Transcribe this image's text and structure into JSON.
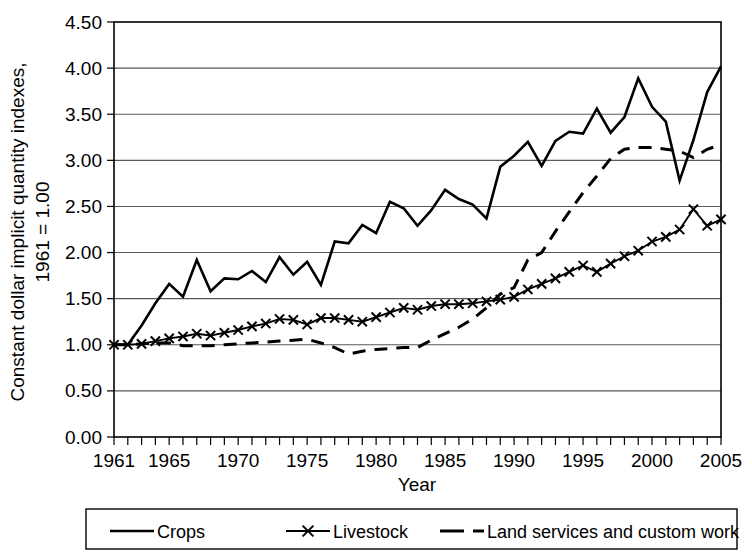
{
  "chart_data": {
    "type": "line",
    "title": "",
    "xlabel": "Year",
    "ylabel": "Constant dollar implicit quantity indexes, 1961 = 1.00",
    "ylabel_line1": "Constant dollar implicit quantity indexes,",
    "ylabel_line2": "1961 = 1.00",
    "xlim": [
      1961,
      2005
    ],
    "ylim": [
      0.0,
      4.5
    ],
    "ytick_labels": [
      "0.00",
      "0.50",
      "1.00",
      "1.50",
      "2.00",
      "2.50",
      "3.00",
      "3.50",
      "4.00",
      "4.50"
    ],
    "ytick_values": [
      0.0,
      0.5,
      1.0,
      1.5,
      2.0,
      2.5,
      3.0,
      3.5,
      4.0,
      4.5
    ],
    "xtick_labels": [
      "1961",
      "1965",
      "1970",
      "1975",
      "1980",
      "1985",
      "1990",
      "1995",
      "2000",
      "2005"
    ],
    "xtick_values": [
      1961,
      1965,
      1970,
      1975,
      1980,
      1985,
      1990,
      1995,
      2000,
      2005
    ],
    "grid": "horizontal",
    "legend_position": "bottom",
    "x": [
      1961,
      1962,
      1963,
      1964,
      1965,
      1966,
      1967,
      1968,
      1969,
      1970,
      1971,
      1972,
      1973,
      1974,
      1975,
      1976,
      1977,
      1978,
      1979,
      1980,
      1981,
      1982,
      1983,
      1984,
      1985,
      1986,
      1987,
      1988,
      1989,
      1990,
      1991,
      1992,
      1993,
      1994,
      1995,
      1996,
      1997,
      1998,
      1999,
      2000,
      2001,
      2002,
      2003,
      2004,
      2005
    ],
    "series": [
      {
        "name": "Crops",
        "style": "solid",
        "marker": "none",
        "color": "#000000",
        "values": [
          1.0,
          1.0,
          1.21,
          1.45,
          1.66,
          1.52,
          1.92,
          1.58,
          1.72,
          1.71,
          1.8,
          1.68,
          1.95,
          1.76,
          1.9,
          1.65,
          2.12,
          2.1,
          2.3,
          2.21,
          2.55,
          2.48,
          2.29,
          2.46,
          2.68,
          2.58,
          2.52,
          2.37,
          2.93,
          3.05,
          3.2,
          2.94,
          3.21,
          3.31,
          3.29,
          3.56,
          3.3,
          3.47,
          3.89,
          3.58,
          3.42,
          2.78,
          3.22,
          3.74,
          4.02
        ]
      },
      {
        "name": "Livestock",
        "style": "solid",
        "marker": "x",
        "color": "#000000",
        "values": [
          1.0,
          1.0,
          1.01,
          1.04,
          1.07,
          1.09,
          1.12,
          1.1,
          1.13,
          1.16,
          1.2,
          1.23,
          1.28,
          1.27,
          1.22,
          1.29,
          1.29,
          1.27,
          1.25,
          1.3,
          1.35,
          1.4,
          1.38,
          1.42,
          1.44,
          1.44,
          1.45,
          1.47,
          1.49,
          1.52,
          1.6,
          1.66,
          1.72,
          1.79,
          1.86,
          1.79,
          1.88,
          1.96,
          2.02,
          2.12,
          2.17,
          2.25,
          2.47,
          2.29,
          2.36
        ]
      },
      {
        "name": "Land services and custom work",
        "style": "dashed",
        "marker": "none",
        "color": "#000000",
        "values": [
          1.0,
          1.0,
          1.01,
          1.02,
          1.02,
          0.99,
          0.99,
          0.99,
          1.0,
          1.01,
          1.02,
          1.03,
          1.04,
          1.05,
          1.06,
          1.02,
          0.97,
          0.9,
          0.93,
          0.95,
          0.96,
          0.97,
          0.97,
          1.05,
          1.12,
          1.19,
          1.28,
          1.4,
          1.55,
          1.62,
          1.92,
          2.0,
          2.23,
          2.44,
          2.65,
          2.83,
          3.02,
          3.12,
          3.14,
          3.14,
          3.12,
          3.1,
          3.03,
          3.12,
          3.17
        ]
      }
    ]
  },
  "legend": {
    "items": [
      {
        "label": "Crops",
        "style": "solid",
        "marker": "none"
      },
      {
        "label": "Livestock",
        "style": "solid",
        "marker": "x"
      },
      {
        "label": "Land services and custom work",
        "style": "dashed",
        "marker": "none"
      }
    ]
  }
}
